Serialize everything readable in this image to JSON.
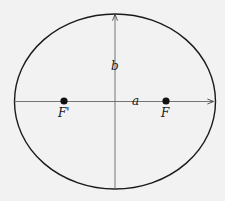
{
  "diagram": {
    "type": "ellipse",
    "colors": {
      "background": "#f2f2f2",
      "stroke": "#1a1a1a",
      "axis": "#555555"
    },
    "labels": {
      "semi_major": "a",
      "semi_minor": "b",
      "focus_left": "F'",
      "focus_right": "F"
    }
  }
}
